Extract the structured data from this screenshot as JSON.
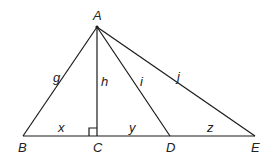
{
  "figure": {
    "type": "geometry-triangle",
    "points": {
      "A": {
        "label": "A",
        "x": 97,
        "y": 27
      },
      "B": {
        "label": "B",
        "x": 23,
        "y": 136
      },
      "C": {
        "label": "C",
        "x": 97,
        "y": 136
      },
      "D": {
        "label": "D",
        "x": 170,
        "y": 136
      },
      "E": {
        "label": "E",
        "x": 255,
        "y": 136
      }
    },
    "segments": {
      "g": {
        "label": "g",
        "from": "A",
        "to": "B"
      },
      "h": {
        "label": "h",
        "from": "A",
        "to": "C"
      },
      "i": {
        "label": "i",
        "from": "A",
        "to": "D"
      },
      "j": {
        "label": "j",
        "from": "A",
        "to": "E"
      },
      "x": {
        "label": "x",
        "from": "B",
        "to": "C"
      },
      "y": {
        "label": "y",
        "from": "C",
        "to": "D"
      },
      "z": {
        "label": "z",
        "from": "D",
        "to": "E"
      }
    },
    "right_angle_at": "C"
  }
}
